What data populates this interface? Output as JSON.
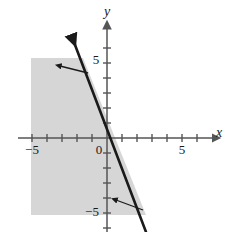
{
  "figure": {
    "kind": "coordinate-plane-inequality-graph",
    "background_color": "#ffffff",
    "ink_color": "#1a1a1a",
    "axis_color": "#555555",
    "shade_color": "#d6d6d6",
    "origin_px": [
      107,
      138
    ],
    "unit_px": 15
  },
  "axes": {
    "x_axis": {
      "label": "x",
      "label_pos_px": [
        216,
        137
      ],
      "y_px": 138,
      "start_px": 18,
      "end_px": 213,
      "range": [
        -6,
        7
      ]
    },
    "y_axis": {
      "label": "y",
      "label_pos_px": [
        104,
        16
      ],
      "x_px": 107,
      "start_px": 232,
      "end_px": 28,
      "range": [
        -6.3,
        7.3
      ]
    },
    "tick_step": 1,
    "tick_half_len_px": 4
  },
  "tick_labels": {
    "x": [
      {
        "text": "−5",
        "value": -5,
        "pos_px": [
          32,
          154
        ]
      },
      {
        "text": "0",
        "value": 0,
        "pos_px": [
          99,
          154
        ]
      },
      {
        "text": "5",
        "value": 5,
        "pos_px": [
          182,
          154
        ]
      }
    ],
    "y": [
      {
        "text": "5",
        "value": 5,
        "pos_px": [
          96,
          64
        ]
      },
      {
        "text": "−5",
        "value": -5,
        "pos_px": [
          92,
          216
        ]
      }
    ]
  },
  "chart_data": {
    "type": "line",
    "title": "",
    "xlabel": "x",
    "ylabel": "y",
    "xlim": [
      -6,
      7
    ],
    "ylim": [
      -6.3,
      7.3
    ],
    "grid": false,
    "legend": "none",
    "boundary_line": {
      "style": "solid",
      "slope": -2.7,
      "intercept": 0,
      "passes_through": [
        [
          0,
          0
        ]
      ],
      "endpoints_px": [
        [
          72,
          37
        ],
        [
          146,
          232
        ]
      ],
      "arrowheads": [
        "start"
      ],
      "width_px": 2.6
    },
    "shaded_region": {
      "description": "region to the left of / above the boundary line",
      "fill": "#d6d6d6",
      "polygon_px": [
        [
          31,
          58
        ],
        [
          83,
          58
        ],
        [
          146,
          215
        ],
        [
          31,
          215
        ]
      ]
    },
    "annotations": [
      {
        "name": "upper-shading-pointer",
        "from_px": [
          88,
          73
        ],
        "to_px": [
          60,
          66
        ]
      },
      {
        "name": "lower-shading-pointer",
        "from_px": [
          143,
          210
        ],
        "to_px": [
          116,
          200
        ]
      }
    ]
  }
}
